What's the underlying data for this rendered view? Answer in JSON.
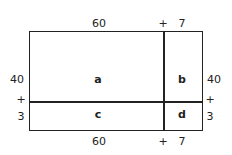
{
  "diagram": {
    "type": "area-model",
    "top_labels": {
      "width_a": "60",
      "plus": "+",
      "width_b": "7"
    },
    "bottom_labels": {
      "width_a": "60",
      "plus": "+",
      "width_b": "7"
    },
    "left_labels": {
      "height_a": "40",
      "plus": "+",
      "height_b": "3"
    },
    "right_labels": {
      "height_a": "40",
      "plus": "+",
      "height_b": "3"
    },
    "cells": {
      "a": "a",
      "b": "b",
      "c": "c",
      "d": "d"
    },
    "line_color": "#222222"
  }
}
